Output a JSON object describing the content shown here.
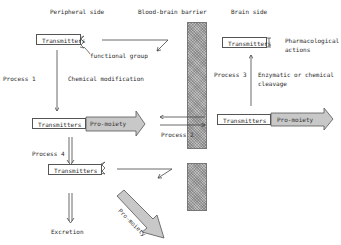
{
  "headers": {
    "peripheral": "Peripheral side",
    "barrier": "Blood-brain barrier",
    "brain": "Brain side"
  },
  "boxes": {
    "top_left": "Transmitters",
    "mid_left": "Transmitters",
    "mid_left_moiety": "Pro-moiety",
    "mid_right": "Transmitters",
    "mid_right_moiety": "Pro-moiety",
    "bottom_left": "Transmitters",
    "top_right": "Transmitters",
    "diagonal_moiety": "Pro-moiety"
  },
  "labels": {
    "functional_group": "functional group",
    "process1": "Process 1",
    "chemical_modification": "Chemical modification",
    "process2": "Process 2",
    "process3": "Process 3",
    "enzymatic_line1": "Enzymatic or chemical",
    "enzymatic_line2": "cleavage",
    "pharmacological_line1": "Pharmacological",
    "pharmacological_line2": "actions",
    "process4": "Process 4",
    "excretion": "Excretion"
  },
  "colors": {
    "barrier_fill": "#bdbdbd",
    "moiety_fill": "#c8c8c8",
    "line": "#555555"
  }
}
